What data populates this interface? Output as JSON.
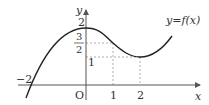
{
  "diagram": {
    "type": "function-graph",
    "curve_label": "y=f(x)",
    "axis_labels": {
      "x": "x",
      "y": "y",
      "origin": "O"
    },
    "x_ticks": [
      {
        "label": "−2",
        "value": -2
      },
      {
        "label": "1",
        "value": 1
      },
      {
        "label": "2",
        "value": 2
      }
    ],
    "y_ticks": [
      {
        "label": "2",
        "value": 2
      },
      {
        "label": "3",
        "value": 1.5,
        "denominator": "2"
      },
      {
        "label": "1",
        "value": 1
      }
    ],
    "key_points": [
      {
        "x": 0,
        "y": 2,
        "note": "local maximum"
      },
      {
        "x": 1,
        "y": 1.5,
        "note": "dashed guide"
      },
      {
        "x": 2,
        "y": 1,
        "note": "local minimum"
      },
      {
        "x": -2,
        "y": 0,
        "note": "x-intercept"
      }
    ],
    "colors": {
      "curve": "#222222",
      "axes": "#555555",
      "guides": "#999999"
    }
  }
}
